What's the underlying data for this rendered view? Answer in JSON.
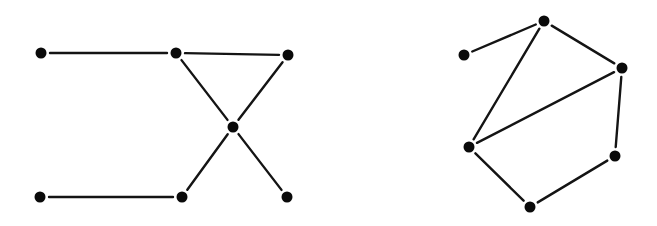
{
  "graphs": [
    {
      "id": "left",
      "nodes": [
        {
          "id": "A",
          "x": 41,
          "y": 53
        },
        {
          "id": "B",
          "x": 176,
          "y": 53
        },
        {
          "id": "C",
          "x": 288,
          "y": 55
        },
        {
          "id": "D",
          "x": 233,
          "y": 127
        },
        {
          "id": "E",
          "x": 40,
          "y": 197
        },
        {
          "id": "F",
          "x": 182,
          "y": 197
        },
        {
          "id": "G",
          "x": 287,
          "y": 197
        }
      ],
      "edges": [
        [
          "A",
          "B"
        ],
        [
          "B",
          "C"
        ],
        [
          "B",
          "D"
        ],
        [
          "C",
          "D"
        ],
        [
          "D",
          "F"
        ],
        [
          "D",
          "G"
        ],
        [
          "E",
          "F"
        ]
      ]
    },
    {
      "id": "right",
      "nodes": [
        {
          "id": "P",
          "x": 464,
          "y": 55
        },
        {
          "id": "Q",
          "x": 544,
          "y": 21
        },
        {
          "id": "R",
          "x": 622,
          "y": 68
        },
        {
          "id": "S",
          "x": 469,
          "y": 147
        },
        {
          "id": "T",
          "x": 615,
          "y": 156
        },
        {
          "id": "U",
          "x": 530,
          "y": 207
        }
      ],
      "edges": [
        [
          "P",
          "Q"
        ],
        [
          "Q",
          "R"
        ],
        [
          "Q",
          "S"
        ],
        [
          "R",
          "S"
        ],
        [
          "R",
          "T"
        ],
        [
          "S",
          "U"
        ],
        [
          "T",
          "U"
        ]
      ]
    }
  ],
  "style": {
    "node_color": "#0a0a0a",
    "edge_color": "#141414",
    "node_radius": 5.5,
    "edge_gap": 9
  }
}
